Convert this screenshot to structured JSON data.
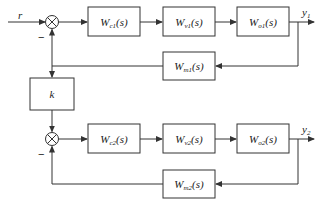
{
  "diagram": {
    "type": "cascade-ratio control block diagram",
    "input": {
      "label": "r"
    },
    "loop1": {
      "junction_sign": "−",
      "blocks": [
        {
          "id": "Wc1",
          "base": "W",
          "sub": "c1",
          "arg": "(s)"
        },
        {
          "id": "Wv1",
          "base": "W",
          "sub": "v1",
          "arg": "(s)"
        },
        {
          "id": "Wo1",
          "base": "W",
          "sub": "o1",
          "arg": "(s)"
        }
      ],
      "feedback": {
        "id": "Wm1",
        "base": "W",
        "sub": "m1",
        "arg": "(s)"
      },
      "output": {
        "base": "y",
        "sub": "1"
      }
    },
    "gain": {
      "label": "k"
    },
    "loop2": {
      "junction_sign": "−",
      "blocks": [
        {
          "id": "Wc2",
          "base": "W",
          "sub": "c2",
          "arg": "(s)"
        },
        {
          "id": "Wv2",
          "base": "W",
          "sub": "v2",
          "arg": "(s)"
        },
        {
          "id": "Wo2",
          "base": "W",
          "sub": "o2",
          "arg": "(s)"
        }
      ],
      "feedback": {
        "id": "Wm2",
        "base": "W",
        "sub": "m2",
        "arg": "(s)"
      },
      "output": {
        "base": "y",
        "sub": "2"
      }
    }
  }
}
